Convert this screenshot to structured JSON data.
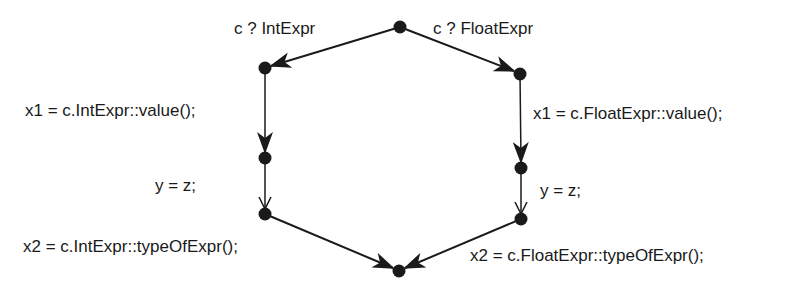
{
  "diagram": {
    "nodes": [
      {
        "id": "start",
        "x": 400,
        "y": 27
      },
      {
        "id": "int1",
        "x": 265,
        "y": 68
      },
      {
        "id": "float1",
        "x": 520,
        "y": 74
      },
      {
        "id": "int2",
        "x": 265,
        "y": 158
      },
      {
        "id": "float2",
        "x": 521,
        "y": 168
      },
      {
        "id": "int3",
        "x": 265,
        "y": 214
      },
      {
        "id": "float3",
        "x": 521,
        "y": 219
      },
      {
        "id": "end",
        "x": 399,
        "y": 271
      }
    ],
    "edges": [
      {
        "from": "start",
        "to": "int1",
        "label": "c ? IntExpr",
        "arrow": "filled"
      },
      {
        "from": "start",
        "to": "float1",
        "label": "c ? FloatExpr",
        "arrow": "filled"
      },
      {
        "from": "int1",
        "to": "int2",
        "label": "x1 = c.IntExpr::value();",
        "arrow": "filled"
      },
      {
        "from": "float1",
        "to": "float2",
        "label": "x1 = c.FloatExpr::value();",
        "arrow": "filled"
      },
      {
        "from": "int2",
        "to": "int3",
        "label": "y = z;",
        "arrow": "open"
      },
      {
        "from": "float2",
        "to": "float3",
        "label": "y = z;",
        "arrow": "open"
      },
      {
        "from": "int3",
        "to": "end",
        "label": "x2 = c.IntExpr::typeOfExpr();",
        "arrow": "filled"
      },
      {
        "from": "float3",
        "to": "end",
        "label": "x2 = c.FloatExpr::typeOfExpr();",
        "arrow": "filled"
      }
    ]
  },
  "labels": {
    "cond_int": "c ? IntExpr",
    "cond_float": "c ? FloatExpr",
    "int_value": "x1 = c.IntExpr::value();",
    "float_value": "x1 = c.FloatExpr::value();",
    "int_assign": "y = z;",
    "float_assign": "y = z;",
    "int_type": "x2 = c.IntExpr::typeOfExpr();",
    "float_type": "x2 = c.FloatExpr::typeOfExpr();"
  },
  "colors": {
    "ink": "#1a1a1a",
    "background": "#ffffff"
  }
}
